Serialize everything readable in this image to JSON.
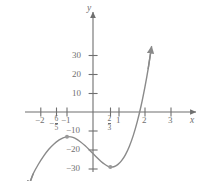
{
  "chart_data": {
    "type": "line",
    "title": "",
    "xlabel": "x",
    "ylabel": "y",
    "xlim": [
      -2.75,
      3.55
    ],
    "ylim": [
      -38,
      38
    ],
    "grid": false,
    "legend": false,
    "function_description": "cubic curve with local maximum and local minimum",
    "x_ticks": [
      {
        "value": -2,
        "label": "−2",
        "kind": "plain"
      },
      {
        "value": -1.2,
        "label": "−6/5",
        "kind": "fraction",
        "sign": "−",
        "numerator": "6",
        "denominator": "5"
      },
      {
        "value": -1,
        "label": "−1",
        "kind": "plain"
      },
      {
        "value": 0.6667,
        "label": "2/3",
        "kind": "fraction",
        "sign": "",
        "numerator": "2",
        "denominator": "3"
      },
      {
        "value": 1,
        "label": "1",
        "kind": "plain"
      },
      {
        "value": 2,
        "label": "2",
        "kind": "plain"
      },
      {
        "value": 3,
        "label": "3",
        "kind": "plain"
      }
    ],
    "y_ticks": [
      {
        "value": 30,
        "label": "30"
      },
      {
        "value": 20,
        "label": "20"
      },
      {
        "value": 10,
        "label": "10"
      },
      {
        "value": -10,
        "label": "−10"
      },
      {
        "value": -20,
        "label": "−20"
      },
      {
        "value": -30,
        "label": "−30"
      }
    ],
    "marked_points": [
      {
        "x": -1,
        "y": -13,
        "role": "local-maximum"
      },
      {
        "x": 0.6667,
        "y": -29,
        "role": "local-minimum"
      }
    ],
    "curve_points": [
      {
        "x": -2.45,
        "y": -38
      },
      {
        "x": -2.3,
        "y": -32.5
      },
      {
        "x": -2.1,
        "y": -27.5
      },
      {
        "x": -1.9,
        "y": -23.2
      },
      {
        "x": -1.7,
        "y": -19.6
      },
      {
        "x": -1.5,
        "y": -16.8
      },
      {
        "x": -1.3,
        "y": -14.7
      },
      {
        "x": -1.15,
        "y": -13.6
      },
      {
        "x": -1.0,
        "y": -13.0
      },
      {
        "x": -0.85,
        "y": -13.1
      },
      {
        "x": -0.7,
        "y": -13.8
      },
      {
        "x": -0.5,
        "y": -15.5
      },
      {
        "x": -0.3,
        "y": -17.8
      },
      {
        "x": -0.1,
        "y": -20.5
      },
      {
        "x": 0.1,
        "y": -23.3
      },
      {
        "x": 0.3,
        "y": -25.9
      },
      {
        "x": 0.45,
        "y": -27.5
      },
      {
        "x": 0.6,
        "y": -28.7
      },
      {
        "x": 0.6667,
        "y": -29.0
      },
      {
        "x": 0.8,
        "y": -28.8
      },
      {
        "x": 0.95,
        "y": -27.7
      },
      {
        "x": 1.1,
        "y": -25.6
      },
      {
        "x": 1.25,
        "y": -22.4
      },
      {
        "x": 1.4,
        "y": -18.0
      },
      {
        "x": 1.55,
        "y": -12.3
      },
      {
        "x": 1.7,
        "y": -5.2
      },
      {
        "x": 1.85,
        "y": 3.3
      },
      {
        "x": 2.0,
        "y": 13.4
      },
      {
        "x": 2.12,
        "y": 22.6
      },
      {
        "x": 2.22,
        "y": 31.5
      }
    ],
    "arrows": [
      {
        "end": "lower-left",
        "direction": "down-left"
      },
      {
        "end": "upper-right",
        "direction": "up-right"
      }
    ],
    "axis_arrows": [
      "x-positive",
      "y-positive"
    ]
  },
  "style": {
    "curve_color": "#8a8a8a",
    "axis_color": "#6f6f6f",
    "text_color": "#6f6f6f",
    "point_color": "#9a9a9a",
    "background": "#ffffff"
  }
}
